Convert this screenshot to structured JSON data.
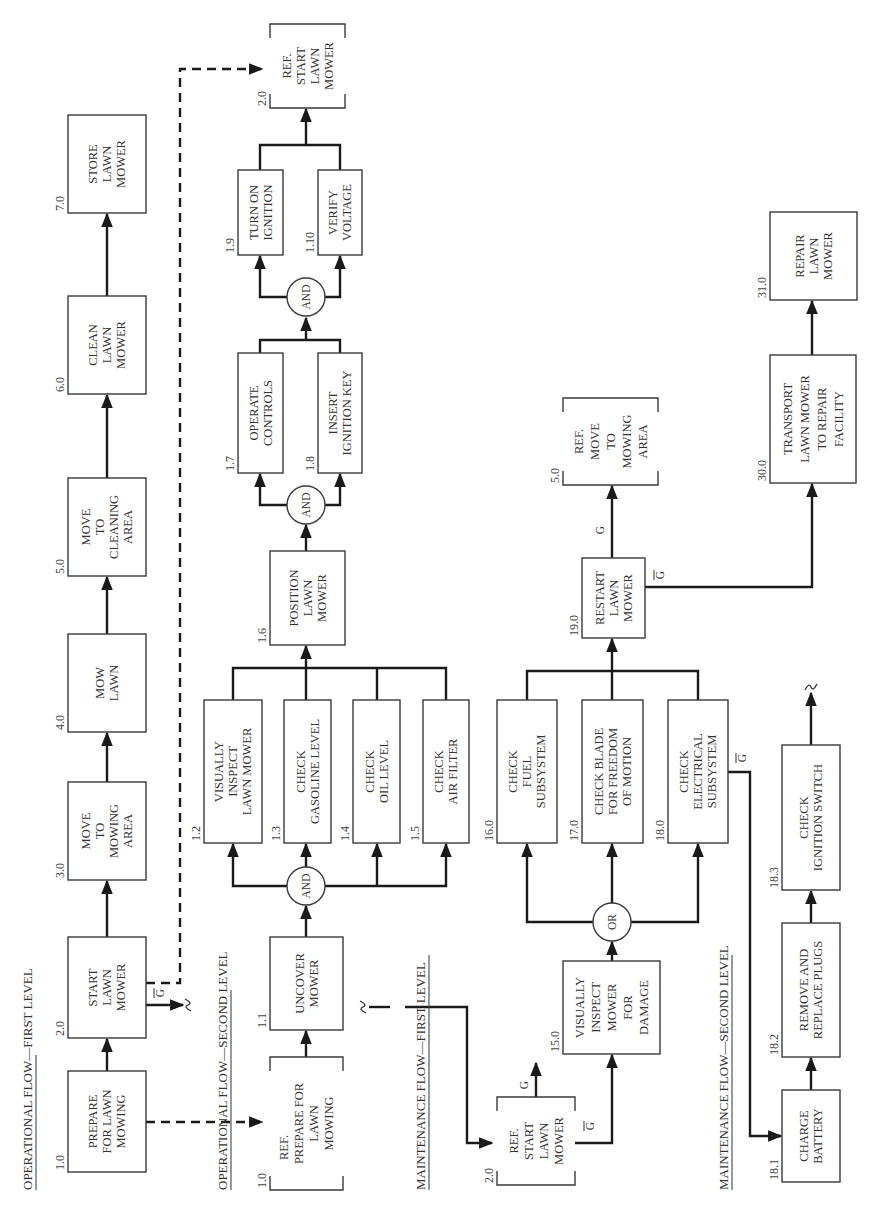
{
  "diagram": {
    "sections": {
      "op1": "OPERATIONAL FLOW—FIRST LEVEL",
      "op2": "OPERATIONAL FLOW—SECOND LEVEL",
      "mt1": "MAINTENANCE FLOW—FIRST LEVEL",
      "mt2": "MAINTENANCE FLOW—SECOND LEVEL"
    },
    "ref_label": "REF.",
    "g": "G",
    "gbar": "G",
    "gates": {
      "and": "AND",
      "or": "OR"
    },
    "op1": [
      {
        "id": "1.0",
        "lines": [
          "PREPARE",
          "FOR LAWN",
          "MOWING"
        ]
      },
      {
        "id": "2.0",
        "lines": [
          "START",
          "LAWN",
          "MOWER"
        ]
      },
      {
        "id": "3.0",
        "lines": [
          "MOVE",
          "TO",
          "MOWING",
          "AREA"
        ]
      },
      {
        "id": "4.0",
        "lines": [
          "MOW",
          "LAWN"
        ]
      },
      {
        "id": "5.0",
        "lines": [
          "MOVE",
          "TO",
          "CLEANING",
          "AREA"
        ]
      },
      {
        "id": "6.0",
        "lines": [
          "CLEAN",
          "LAWN",
          "MOWER"
        ]
      },
      {
        "id": "7.0",
        "lines": [
          "STORE",
          "LAWN",
          "MOWER"
        ]
      }
    ],
    "op2": {
      "ref_prepare": {
        "id": "1.0",
        "lines": [
          "PREPARE FOR",
          "LAWN",
          "MOWING"
        ]
      },
      "b11": {
        "id": "1.1",
        "lines": [
          "UNCOVER",
          "MOWER"
        ]
      },
      "b12": {
        "id": "1.2",
        "lines": [
          "VISUALLY",
          "INSPECT",
          "LAWN MOWER"
        ]
      },
      "b13": {
        "id": "1.3",
        "lines": [
          "CHECK",
          "GASOLINE LEVEL"
        ]
      },
      "b14": {
        "id": "1.4",
        "lines": [
          "CHECK",
          "OIL LEVEL"
        ]
      },
      "b15": {
        "id": "1.5",
        "lines": [
          "CHECK",
          "AIR FILTER"
        ]
      },
      "b16": {
        "id": "1.6",
        "lines": [
          "POSITION",
          "LAWN",
          "MOWER"
        ]
      },
      "b17": {
        "id": "1.7",
        "lines": [
          "OPERATE",
          "CONTROLS"
        ]
      },
      "b18": {
        "id": "1.8",
        "lines": [
          "INSERT",
          "IGNITION KEY"
        ]
      },
      "b19": {
        "id": "1.9",
        "lines": [
          "TURN ON",
          "IGNITION"
        ]
      },
      "b110": {
        "id": "1.10",
        "lines": [
          "VERIFY",
          "VOLTAGE"
        ]
      },
      "ref_start": {
        "id": "2.0",
        "lines": [
          "START",
          "LAWN",
          "MOWER"
        ]
      }
    },
    "mt1": {
      "ref_start": {
        "id": "2.0",
        "lines": [
          "START",
          "LAWN",
          "MOWER"
        ]
      },
      "b15": {
        "id": "15.0",
        "lines": [
          "VISUALLY",
          "INSPECT",
          "MOWER",
          "FOR",
          "DAMAGE"
        ]
      },
      "b16": {
        "id": "16.0",
        "lines": [
          "CHECK",
          "FUEL",
          "SUBSYSTEM"
        ]
      },
      "b17": {
        "id": "17.0",
        "lines": [
          "CHECK BLADE",
          "FOR FREEDOM",
          "OF MOTION"
        ]
      },
      "b18": {
        "id": "18.0",
        "lines": [
          "CHECK",
          "ELECTRICAL",
          "SUBSYSTEM"
        ]
      },
      "b19": {
        "id": "19.0",
        "lines": [
          "RESTART",
          "LAWN",
          "MOWER"
        ]
      },
      "ref_move": {
        "id": "5.0",
        "lines": [
          "MOVE",
          "TO",
          "MOWING",
          "AREA"
        ]
      },
      "b30": {
        "id": "30.0",
        "lines": [
          "TRANSPORT",
          "LAWN MOWER",
          "TO REPAIR",
          "FACILITY"
        ]
      },
      "b31": {
        "id": "31.0",
        "lines": [
          "REPAIR",
          "LAWN",
          "MOWER"
        ]
      }
    },
    "mt2": {
      "b181": {
        "id": "18.1",
        "lines": [
          "CHARGE",
          "BATTERY"
        ]
      },
      "b182": {
        "id": "18.2",
        "lines": [
          "REMOVE AND",
          "REPLACE PLUGS"
        ]
      },
      "b183": {
        "id": "18.3",
        "lines": [
          "CHECK",
          "IGNITION SWITCH"
        ]
      }
    }
  }
}
